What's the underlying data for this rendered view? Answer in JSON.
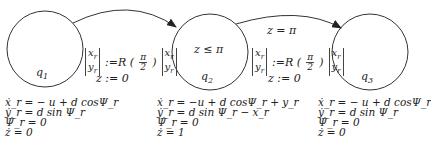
{
  "states": [
    {
      "id": "q1",
      "label": "q",
      "sub": "1",
      "invariant": "",
      "flow": [
        "ẋ_r = − u + d cosΨ_r",
        "ẏ_r = d sin Ψ_r",
        "Ψ̇_r = 0",
        "ż = 0"
      ]
    },
    {
      "id": "q2",
      "label": "q",
      "sub": "2",
      "invariant": "z ≤ π",
      "flow": [
        "ẋ_r = −u + d cosΨ_r + y_r",
        "ẏ_r = d sin Ψ_r − x_r",
        "Ψ̇_r = 0",
        "ż = 1"
      ]
    },
    {
      "id": "q3",
      "label": "q",
      "sub": "3",
      "invariant": "",
      "flow": [
        "ẋ_r = − u + d cosΨ_r",
        "ẏ_r = d sin Ψ_r",
        "Ψ̇_r = 0",
        "ż = 0"
      ]
    }
  ],
  "transitions": [
    {
      "from": "q1",
      "to": "q2",
      "guard": "",
      "reset_vec_top": "x",
      "reset_vec_bot": "y",
      "reset_op": ":=R (",
      "frac_num": "π",
      "frac_den": "2",
      "reset_close": ")",
      "reset_z": "z := 0"
    },
    {
      "from": "q2",
      "to": "q3",
      "guard": "z = π",
      "reset_vec_top": "x",
      "reset_vec_bot": "y",
      "reset_op": ":=R (",
      "frac_num": "π",
      "frac_den": "2",
      "reset_close": ")",
      "reset_z": "z := 0"
    }
  ]
}
